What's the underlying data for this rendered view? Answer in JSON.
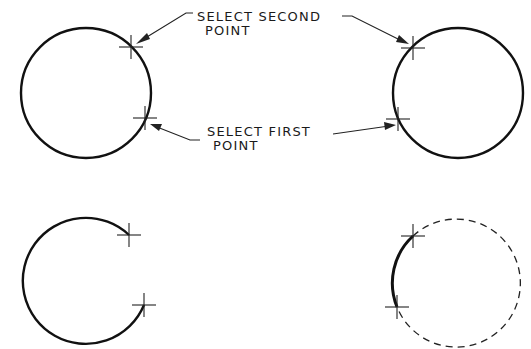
{
  "diagram": {
    "type": "cad-arc-break-illustration",
    "labels": {
      "second_point": {
        "line1": "SELECT SECOND",
        "line2": "POINT"
      },
      "first_point": {
        "line1": "SELECT FIRST",
        "line2": "POINT"
      }
    },
    "figures": [
      {
        "id": "top-left",
        "shape": "full-circle",
        "center": [
          86,
          93
        ],
        "radius": 65,
        "points": [
          [
            131,
            47
          ],
          [
            145,
            118
          ]
        ],
        "point_roles": [
          "second",
          "first"
        ]
      },
      {
        "id": "top-right",
        "shape": "full-circle",
        "center": [
          458,
          93
        ],
        "radius": 65,
        "points": [
          [
            413,
            48
          ],
          [
            398,
            119
          ]
        ],
        "point_roles": [
          "second",
          "first"
        ]
      },
      {
        "id": "bottom-left",
        "shape": "arc-with-gap",
        "center": [
          84,
          279
        ],
        "radius": 63,
        "points": [
          [
            129,
            235
          ],
          [
            144,
            305
          ]
        ],
        "note": "result: segment between the two points removed"
      },
      {
        "id": "bottom-right",
        "shape": "short-arc-with-dashed-remainder",
        "center": [
          457,
          281
        ],
        "radius": 64,
        "points": [
          [
            413,
            236
          ],
          [
            397,
            307
          ]
        ],
        "note": "result: only the segment between the points remains; remainder shown dashed"
      }
    ],
    "colors": {
      "stroke": "#111111",
      "background": "#ffffff"
    }
  }
}
